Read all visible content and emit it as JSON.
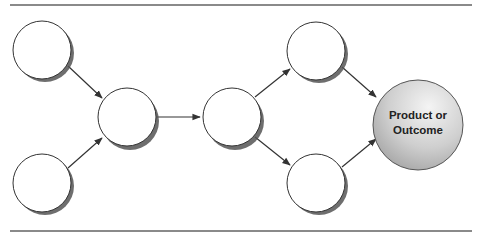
{
  "diagram": {
    "type": "flow",
    "nodes": [
      {
        "id": "n1",
        "label": ""
      },
      {
        "id": "n2",
        "label": ""
      },
      {
        "id": "n3",
        "label": ""
      },
      {
        "id": "n4",
        "label": ""
      },
      {
        "id": "n5",
        "label": ""
      },
      {
        "id": "n6",
        "label": ""
      },
      {
        "id": "outcome",
        "label_line1": "Product or",
        "label_line2": "Outcome"
      }
    ],
    "edges": [
      [
        "n1",
        "n3"
      ],
      [
        "n2",
        "n3"
      ],
      [
        "n3",
        "n4"
      ],
      [
        "n4",
        "n5"
      ],
      [
        "n4",
        "n6"
      ],
      [
        "n5",
        "outcome"
      ],
      [
        "n6",
        "outcome"
      ]
    ],
    "colors": {
      "outcome_fill": "#c8c8c8",
      "node_fill": "#ffffff",
      "stroke": "#333333",
      "rule": "#8a8a8a"
    }
  }
}
